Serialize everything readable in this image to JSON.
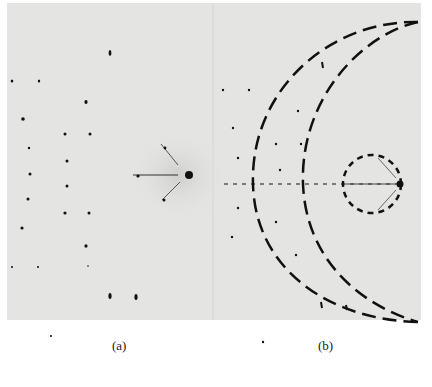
{
  "figure": {
    "panels": [
      {
        "id": "a",
        "caption": "(a)",
        "description": "diffraction spot pattern"
      },
      {
        "id": "b",
        "caption": "(b)",
        "description": "diffraction pattern with dashed construction circles"
      }
    ],
    "colors": {
      "plate": "#e4e4e2",
      "ink": "#111111",
      "background": "#ffffff"
    }
  }
}
